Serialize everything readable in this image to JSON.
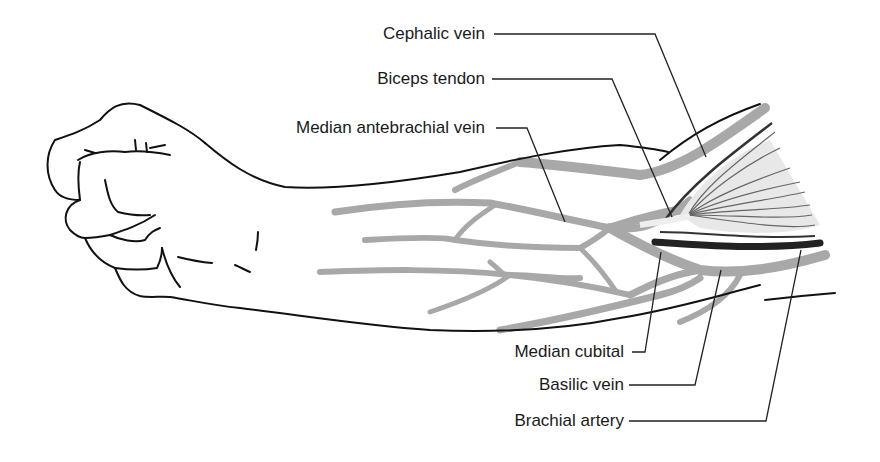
{
  "diagram": {
    "colors": {
      "outline": "#111111",
      "vein": "#a8a8a8",
      "artery": "#222222",
      "muscle_fill": "#e8e8e8",
      "muscle_fiber": "#555555",
      "leader": "#222222"
    }
  },
  "labels": {
    "cephalic_vein": "Cephalic vein",
    "biceps_tendon": "Biceps tendon",
    "median_antebrachial_vein": "Median antebrachial vein",
    "median_cubital": "Median cubital",
    "basilic_vein": "Basilic vein",
    "brachial_artery": "Brachial artery"
  }
}
